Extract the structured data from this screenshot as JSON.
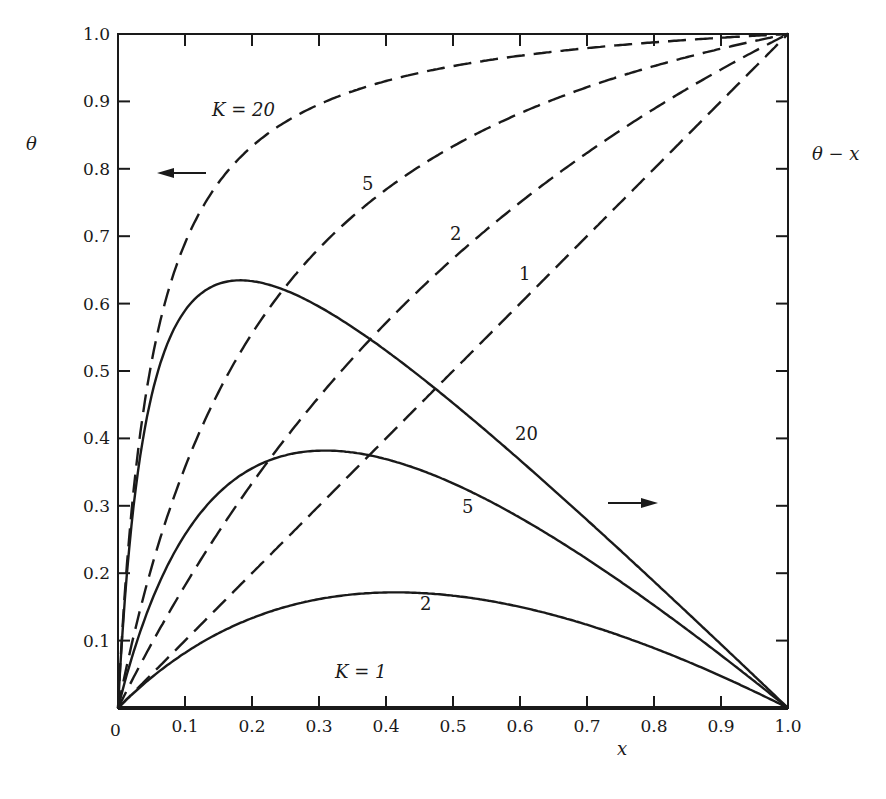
{
  "chart_data": {
    "type": "line",
    "title": "",
    "xlabel": "x",
    "ylabel_left": "θ",
    "ylabel_right": "θ - x",
    "xlim": [
      0,
      1.0
    ],
    "ylim": [
      0,
      1.0
    ],
    "grid": false,
    "x_ticks": [
      "0",
      "0.1",
      "0.2",
      "0.3",
      "0.4",
      "0.5",
      "0.6",
      "0.7",
      "0.8",
      "0.9",
      "1.0"
    ],
    "y_ticks": [
      "0.1",
      "0.2",
      "0.3",
      "0.4",
      "0.5",
      "0.6",
      "0.7",
      "0.8",
      "0.9",
      "1.0"
    ],
    "x": [
      0,
      0.02,
      0.05,
      0.1,
      0.15,
      0.2,
      0.3,
      0.4,
      0.5,
      0.6,
      0.7,
      0.8,
      0.9,
      1.0
    ],
    "series": [
      {
        "name": "θ, K = 1",
        "style": "dashed",
        "axis": "left",
        "values": [
          0,
          0.02,
          0.05,
          0.1,
          0.15,
          0.2,
          0.3,
          0.4,
          0.5,
          0.6,
          0.7,
          0.8,
          0.9,
          1.0
        ]
      },
      {
        "name": "θ, K = 2",
        "style": "dashed",
        "axis": "left",
        "values": [
          0,
          0.039,
          0.095,
          0.182,
          0.261,
          0.333,
          0.462,
          0.571,
          0.667,
          0.75,
          0.824,
          0.889,
          0.947,
          1.0
        ]
      },
      {
        "name": "θ, K = 5",
        "style": "dashed",
        "axis": "left",
        "values": [
          0,
          0.093,
          0.208,
          0.357,
          0.469,
          0.556,
          0.682,
          0.769,
          0.833,
          0.882,
          0.921,
          0.952,
          0.978,
          1.0
        ]
      },
      {
        "name": "θ, K = 20",
        "style": "dashed",
        "axis": "left",
        "values": [
          0,
          0.29,
          0.513,
          0.69,
          0.779,
          0.833,
          0.896,
          0.93,
          0.952,
          0.968,
          0.979,
          0.988,
          0.994,
          1.0
        ]
      },
      {
        "name": "θ - x, K = 1",
        "style": "solid",
        "axis": "right",
        "values": [
          0,
          0,
          0,
          0,
          0,
          0,
          0,
          0,
          0,
          0,
          0,
          0,
          0,
          0
        ]
      },
      {
        "name": "θ - x, K = 2",
        "style": "solid",
        "axis": "right",
        "values": [
          0,
          0.019,
          0.045,
          0.082,
          0.111,
          0.133,
          0.162,
          0.171,
          0.167,
          0.15,
          0.124,
          0.089,
          0.047,
          0
        ]
      },
      {
        "name": "θ - x, K = 5",
        "style": "solid",
        "axis": "right",
        "values": [
          0,
          0.073,
          0.158,
          0.257,
          0.319,
          0.356,
          0.382,
          0.369,
          0.333,
          0.282,
          0.221,
          0.152,
          0.078,
          0
        ]
      },
      {
        "name": "θ - x, K = 20",
        "style": "solid",
        "axis": "right",
        "values": [
          0,
          0.27,
          0.463,
          0.59,
          0.629,
          0.633,
          0.596,
          0.53,
          0.452,
          0.368,
          0.279,
          0.188,
          0.094,
          0
        ]
      }
    ],
    "annotations": [
      {
        "text": "K = 20",
        "near": "dashed K=20 curve, top-left"
      },
      {
        "text": "5",
        "near": "dashed K=5 curve"
      },
      {
        "text": "2",
        "near": "dashed K=2 curve"
      },
      {
        "text": "1",
        "near": "dashed K=1 diagonal"
      },
      {
        "text": "20",
        "near": "solid K=20 curve"
      },
      {
        "text": "5",
        "near": "solid K=5 curve"
      },
      {
        "text": "2",
        "near": "solid K=2 curve"
      },
      {
        "text": "K = 1",
        "near": "x axis (θ - x = 0)"
      },
      {
        "text": "←",
        "meaning": "dashed curves read on left axis θ"
      },
      {
        "text": "→",
        "meaning": "solid curves read on right axis θ - x"
      }
    ]
  },
  "labels": {
    "ylabel_left": "θ",
    "ylabel_right": "θ − x",
    "xlabel": "x",
    "origin": "0",
    "x_ticks": [
      "0.1",
      "0.2",
      "0.3",
      "0.4",
      "0.5",
      "0.6",
      "0.7",
      "0.8",
      "0.9",
      "1.0"
    ],
    "y_ticks": [
      "0.1",
      "0.2",
      "0.3",
      "0.4",
      "0.5",
      "0.6",
      "0.7",
      "0.8",
      "0.9",
      "1.0"
    ],
    "ann_k20": "K = 20",
    "ann_5_dashed": "5",
    "ann_2_dashed": "2",
    "ann_1_dashed": "1",
    "ann_20_solid": "20",
    "ann_5_solid": "5",
    "ann_2_solid": "2",
    "ann_k1": "K = 1"
  }
}
